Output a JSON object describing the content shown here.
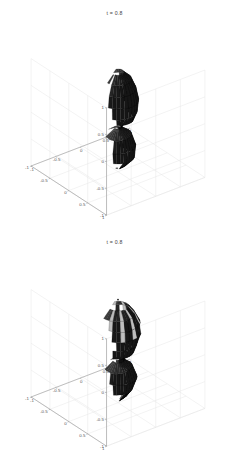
{
  "figure": {
    "background_color": "#ffffff",
    "axis_color": "#9a9a9a",
    "grid_color": "#e4e4e4",
    "surface_color": "#2b2b2b",
    "mesh_color": "#000000",
    "tick_text_color": "#555555"
  },
  "chart_data": [
    {
      "type": "surface",
      "id": "isosurface-top",
      "title": "t = 0.8",
      "xlabel": "",
      "ylabel": "",
      "zlabel": "",
      "xlim": [
        -1,
        1
      ],
      "ylim": [
        -1,
        1
      ],
      "zlim": [
        -1,
        1
      ],
      "grid": true,
      "legend": "none",
      "projection": "3d-orthographic",
      "view_azimuth_deg": -37.5,
      "view_elevation_deg": 30,
      "x_ticks": [
        -1,
        -0.5,
        0,
        0.5,
        1
      ],
      "x_tick_labels": [
        "-1",
        "-0.5",
        "0",
        "0.5",
        "1"
      ],
      "y_ticks": [
        1,
        0.5,
        0,
        -0.5,
        -1
      ],
      "y_tick_labels": [
        "1",
        "0.5",
        "0",
        "-0.5",
        "-1"
      ],
      "z_ticks": [
        1,
        0.5,
        0,
        -0.5,
        -1
      ],
      "z_tick_labels": [
        "1",
        "0.5",
        "0",
        "-0.5",
        "-1"
      ],
      "description": "Smooth dark hourglass / dumbbell isosurface: a larger upper lobe and a smaller lower lobe joined by a thin pinched neck near z = -0.15, rendered as a dense black triangular mesh on dark gray faces.",
      "object_profile_radius": [
        {
          "z": 0.85,
          "r": 0.1
        },
        {
          "z": 0.72,
          "r": 0.22
        },
        {
          "z": 0.55,
          "r": 0.3
        },
        {
          "z": 0.35,
          "r": 0.33
        },
        {
          "z": 0.15,
          "r": 0.31
        },
        {
          "z": 0.0,
          "r": 0.25
        },
        {
          "z": -0.12,
          "r": 0.08
        },
        {
          "z": -0.18,
          "r": 0.06
        },
        {
          "z": -0.3,
          "r": 0.22
        },
        {
          "z": -0.5,
          "r": 0.29
        },
        {
          "z": -0.7,
          "r": 0.26
        },
        {
          "z": -0.85,
          "r": 0.14
        },
        {
          "z": -0.93,
          "r": 0.04
        }
      ]
    },
    {
      "type": "surface",
      "id": "isosurface-bottom",
      "title": "t = 0.8",
      "xlabel": "",
      "ylabel": "",
      "zlabel": "",
      "xlim": [
        -1,
        1
      ],
      "ylim": [
        -1,
        1
      ],
      "zlim": [
        -1,
        1
      ],
      "grid": true,
      "legend": "none",
      "projection": "3d-orthographic",
      "view_azimuth_deg": -37.5,
      "view_elevation_deg": 30,
      "x_ticks": [
        -1,
        -0.5,
        0,
        0.5,
        1
      ],
      "x_tick_labels": [
        "-1",
        "-0.5",
        "0",
        "0.5",
        "1"
      ],
      "y_ticks": [
        1,
        0.5,
        0,
        -0.5,
        -1
      ],
      "y_tick_labels": [
        "1",
        "0.5",
        "0",
        "-0.5",
        "-1"
      ],
      "z_ticks": [
        1,
        0.5,
        0,
        -0.5,
        -1
      ],
      "z_tick_labels": [
        "1",
        "0.5",
        "0",
        "-0.5",
        "-1"
      ],
      "description": "Irregular crumpled dark isosurface of similar two-lobe topology but with rough faceted folds and a speckled bright highlight patch near the top of the upper lobe; a single small dark marker dot sits above the object near z = 0.9.",
      "object_profile_radius": [
        {
          "z": 0.8,
          "r": 0.16
        },
        {
          "z": 0.68,
          "r": 0.27
        },
        {
          "z": 0.5,
          "r": 0.33
        },
        {
          "z": 0.32,
          "r": 0.35
        },
        {
          "z": 0.12,
          "r": 0.33
        },
        {
          "z": -0.02,
          "r": 0.27
        },
        {
          "z": -0.14,
          "r": 0.11
        },
        {
          "z": -0.2,
          "r": 0.09
        },
        {
          "z": -0.32,
          "r": 0.24
        },
        {
          "z": -0.52,
          "r": 0.3
        },
        {
          "z": -0.72,
          "r": 0.26
        },
        {
          "z": -0.86,
          "r": 0.13
        },
        {
          "z": -0.94,
          "r": 0.04
        }
      ],
      "marker_point": {
        "x": 0.0,
        "y": 0.0,
        "z": 0.92
      }
    }
  ]
}
